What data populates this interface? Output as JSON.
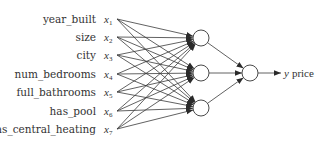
{
  "diagram": {
    "type": "neural-network",
    "colors": {
      "stroke": "#3a3a3a",
      "text": "#333333",
      "node_fill": "#ffffff",
      "background": "#ffffff"
    },
    "inputs": [
      {
        "feature": "year_built",
        "var": "x",
        "index": "1"
      },
      {
        "feature": "size",
        "var": "x",
        "index": "2"
      },
      {
        "feature": "city",
        "var": "x",
        "index": "3"
      },
      {
        "feature": "num_bedrooms",
        "var": "x",
        "index": "4"
      },
      {
        "feature": "full_bathrooms",
        "var": "x",
        "index": "5"
      },
      {
        "feature": "has_pool",
        "var": "x",
        "index": "6"
      },
      {
        "feature": "has_central_heating",
        "var": "x",
        "index": "7"
      }
    ],
    "hidden_layer": {
      "node_count": 3
    },
    "output": {
      "var": "y",
      "label": "price"
    }
  }
}
